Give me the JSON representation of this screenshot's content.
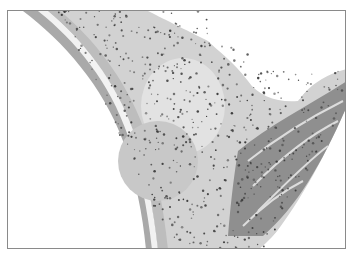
{
  "image": {
    "description": "Grayscale histology micrograph: curved band of fibrous tissue with dense cell nuclei, an outer layered membrane on the left, and muscle bundles on the lower right",
    "frame_color": "#8a8a8a",
    "background": "#ffffff",
    "tissue_light": "#d8d8d8",
    "tissue_mid": "#b4b4b4",
    "muscle": "#8e8e8e",
    "nucleus": "#3a3a3a"
  }
}
